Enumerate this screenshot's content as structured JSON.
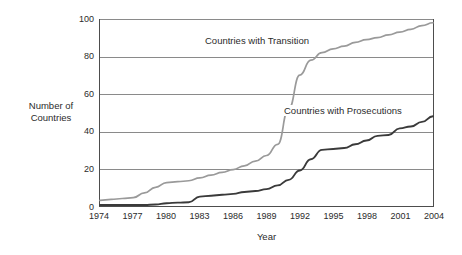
{
  "chart_data": {
    "type": "line",
    "title": "",
    "xlabel": "Year",
    "ylabel": "Number of\nCountries",
    "ylabel_line1": "Number of",
    "ylabel_line2": "Countries",
    "xlim": [
      1974,
      2004
    ],
    "ylim": [
      0,
      100
    ],
    "yticks": [
      0,
      20,
      40,
      60,
      80,
      100
    ],
    "xticks": [
      1974,
      1977,
      1980,
      1983,
      1986,
      1989,
      1992,
      1995,
      1998,
      2001,
      2004
    ],
    "grid": "horizontal",
    "legend": "inline-annotations",
    "x": [
      1974,
      1975,
      1976,
      1977,
      1978,
      1979,
      1980,
      1981,
      1982,
      1983,
      1984,
      1985,
      1986,
      1987,
      1988,
      1989,
      1990,
      1991,
      1992,
      1993,
      1994,
      1995,
      1996,
      1997,
      1998,
      1999,
      2000,
      2001,
      2002,
      2003,
      2004
    ],
    "series": [
      {
        "name": "Countries with Transition",
        "color": "#9a9a9a",
        "values": [
          3,
          3.5,
          4,
          4.5,
          7,
          10,
          12.5,
          13,
          13.5,
          15,
          16.5,
          18,
          19.5,
          21.5,
          24,
          27,
          33,
          52,
          70,
          78,
          82,
          84,
          85.5,
          87.5,
          89,
          90,
          91.5,
          93,
          94.5,
          96.5,
          98
        ]
      },
      {
        "name": "Countries with Prosecutions",
        "color": "#3a3a3a",
        "values": [
          0.5,
          0.5,
          0.5,
          0.5,
          0.5,
          0.8,
          1.5,
          1.8,
          2,
          5,
          5.5,
          6,
          6.5,
          7.5,
          8,
          9,
          11,
          14,
          19,
          25,
          30,
          30.5,
          31,
          33,
          35,
          37.5,
          38,
          41.5,
          42.5,
          45,
          48
        ]
      }
    ],
    "annotations": [
      {
        "text": "Countries with Transition",
        "series": "Countries with Transition"
      },
      {
        "text": "Countries with Prosecutions",
        "series": "Countries with Prosecutions"
      }
    ],
    "axis_color": "#4d4d4d",
    "grid_color": "#8a8a8a",
    "background": "#ffffff"
  }
}
